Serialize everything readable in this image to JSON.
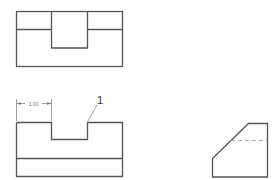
{
  "drawing": {
    "views": [
      "top-view",
      "front-view",
      "side-view"
    ],
    "dimension": {
      "label": "1.00"
    },
    "callout": {
      "label": "1"
    },
    "colors": {
      "line": "#555555",
      "hidden_line": "#999999",
      "background": "#ffffff"
    }
  }
}
